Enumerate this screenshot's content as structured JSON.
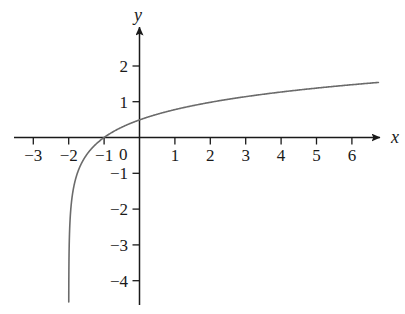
{
  "chart_data": {
    "type": "line",
    "title": "",
    "subtitle": "",
    "xlabel": "x",
    "ylabel": "y",
    "xlim": [
      -3.6,
      7.3
    ],
    "ylim": [
      -4.6,
      2.5
    ],
    "grid": false,
    "legend": null,
    "annotations": [],
    "axis_style": "centered-arrows",
    "x_ticks": [
      -3,
      -2,
      -1,
      1,
      2,
      3,
      4,
      5,
      6
    ],
    "x_tick_labels": [
      "−3",
      "−2",
      "−1",
      "1",
      "2",
      "3",
      "4",
      "5",
      "6"
    ],
    "y_ticks": [
      2,
      1,
      -1,
      -2,
      -3,
      -4
    ],
    "y_tick_labels": [
      "2",
      "1",
      "−1",
      "−2",
      "−3",
      "−4"
    ],
    "origin_label": "0",
    "series": [
      {
        "name": "logarithmic curve",
        "color": "#6b6b6b",
        "line_width": 1.6,
        "asymptote_x": -2,
        "x_intercept": -1,
        "x": [
          -1.98,
          -1.96,
          -1.94,
          -1.92,
          -1.9,
          -1.88,
          -1.85,
          -1.82,
          -1.78,
          -1.74,
          -1.7,
          -1.65,
          -1.6,
          -1.55,
          -1.5,
          -1.45,
          -1.4,
          -1.35,
          -1.3,
          -1.25,
          -1.2,
          -1.15,
          -1.1,
          -1.05,
          -1.0,
          -0.9,
          -0.8,
          -0.6,
          -0.4,
          -0.2,
          0.0,
          0.25,
          0.5,
          0.75,
          1.0,
          1.5,
          2.0,
          2.5,
          3.0,
          3.5,
          4.0,
          4.5,
          5.0,
          5.5,
          6.0,
          6.5,
          6.75
        ],
        "y": [
          -4.45,
          -3.92,
          -3.61,
          -3.39,
          -3.22,
          -3.08,
          -2.9,
          -2.76,
          -2.6,
          -2.46,
          -2.35,
          -2.22,
          -2.11,
          -2.01,
          -1.93,
          -1.85,
          -1.78,
          -1.72,
          -1.66,
          -1.6,
          -1.55,
          -1.5,
          -1.46,
          -1.41,
          -1.37,
          -1.3,
          -1.23,
          -1.1,
          -0.99,
          -0.89,
          -0.8,
          -0.7,
          -0.61,
          -0.53,
          -0.45,
          -0.32,
          -0.2,
          -0.1,
          0.0,
          0.09,
          0.17,
          0.25,
          0.32,
          0.39,
          0.45,
          0.51,
          0.54
        ],
        "note": "y values listed are raw; rendered curve is y = 1.53*ln(x+2)/ln(8.75) shape crossing zero at x=-1"
      }
    ],
    "curve_equation_visual": "y = log_b(x + 2), b ≈ 3.6",
    "curve_points_rendered": [
      {
        "x": -1.0,
        "y": 0.0
      },
      {
        "x": 1.0,
        "y": 0.96
      },
      {
        "x": 3.0,
        "y": 1.24
      },
      {
        "x": 4.0,
        "y": 1.35
      },
      {
        "x": 6.75,
        "y": 1.54
      }
    ]
  },
  "axes": {
    "x_axis_name": "x",
    "y_axis_name": "y",
    "origin_label": "0"
  },
  "colors": {
    "curve": "#6b6b6b",
    "axis": "#1a1a1a",
    "background": "#ffffff",
    "text": "#1a1a1a"
  }
}
